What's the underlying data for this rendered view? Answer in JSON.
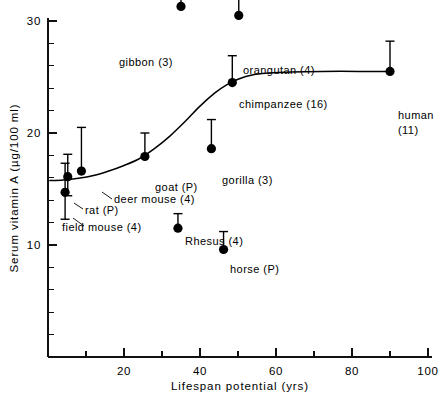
{
  "chart_data": {
    "type": "scatter",
    "title": "",
    "xlabel": "Lifespan potential (yrs)",
    "ylabel": "Serum vitamin A (µg/100 ml)",
    "xlim": [
      0,
      100
    ],
    "ylim": [
      0,
      34
    ],
    "grid": false,
    "legend": "none",
    "x_ticks_major": [
      20,
      40,
      60,
      80,
      100
    ],
    "x_tick_labels": [
      "20",
      "40",
      "60",
      "80",
      "100"
    ],
    "x_ticks_minor": [
      10,
      30,
      50,
      70,
      90
    ],
    "y_ticks_major": [
      10,
      20,
      30
    ],
    "y_tick_labels": [
      "10",
      "20",
      "30"
    ],
    "y_ticks_minor": [
      2,
      4,
      6,
      8,
      12,
      14,
      16,
      18,
      22,
      24,
      26,
      28,
      32,
      34
    ],
    "error_bar_style": "upper-only",
    "points": [
      {
        "name": "field mouse",
        "label": "field mouse (4)",
        "n": "4",
        "x": 4.5,
        "y": 14.7,
        "err_up": 2.6,
        "err_down": 2.4,
        "label_x": 62,
        "label_y": 231,
        "anchor": "start",
        "leader": true,
        "leader_path": "M 73 218 L 84 226"
      },
      {
        "name": "rat",
        "label": "rat (P)",
        "n": "P",
        "x": 5.2,
        "y": 16.1,
        "err_up": 2.0,
        "err_down": 1.7,
        "label_x": 85,
        "label_y": 214,
        "anchor": "start",
        "leader": true,
        "leader_path": "M 74 203 L 83 209"
      },
      {
        "name": "deer mouse",
        "label": "deer mouse (4)",
        "n": "4",
        "x": 8.8,
        "y": 16.6,
        "err_up": 3.9,
        "err_down": 0,
        "label_x": 114,
        "label_y": 203,
        "anchor": "start",
        "leader": true,
        "leader_path": "M 102 192 L 112 199"
      },
      {
        "name": "goat",
        "label": "goat (P)",
        "n": "P",
        "x": 25.5,
        "y": 17.9,
        "err_up": 2.1,
        "err_down": 0,
        "label_x": 155,
        "label_y": 191,
        "anchor": "start",
        "leader": false,
        "leader_path": ""
      },
      {
        "name": "Rhesus",
        "label": "Rhesus (4)",
        "n": "4",
        "x": 34.2,
        "y": 11.5,
        "err_up": 1.3,
        "err_down": 0,
        "label_x": 185,
        "label_y": 245,
        "anchor": "start",
        "leader": false,
        "leader_path": ""
      },
      {
        "name": "gibbon",
        "label": "gibbon (3)",
        "n": "3",
        "x": 35.0,
        "y": 31.3,
        "err_up": 2.3,
        "err_down": 0,
        "label_x": 173,
        "label_y": 66,
        "anchor": "end",
        "leader": false,
        "leader_path": ""
      },
      {
        "name": "gorilla",
        "label": "gorilla (3)",
        "n": "3",
        "x": 43.0,
        "y": 18.6,
        "err_up": 2.6,
        "err_down": 0,
        "label_x": 222,
        "label_y": 184,
        "anchor": "start",
        "leader": false,
        "leader_path": ""
      },
      {
        "name": "horse",
        "label": "horse (P)",
        "n": "P",
        "x": 46.2,
        "y": 9.6,
        "err_up": 1.6,
        "err_down": 0,
        "label_x": 230,
        "label_y": 273,
        "anchor": "start",
        "leader": false,
        "leader_path": ""
      },
      {
        "name": "chimpanzee",
        "label": "chimpanzee (16)",
        "n": "16",
        "x": 48.5,
        "y": 24.5,
        "err_up": 2.4,
        "err_down": 0,
        "label_x": 239,
        "label_y": 108,
        "anchor": "start",
        "leader": false,
        "leader_path": ""
      },
      {
        "name": "orangutan",
        "label": "orangutan (4)",
        "n": "4",
        "x": 50.2,
        "y": 30.5,
        "err_up": 2.5,
        "err_down": 0,
        "label_x": 243,
        "label_y": 74,
        "anchor": "start",
        "leader": false,
        "leader_path": ""
      },
      {
        "name": "human",
        "label": "human",
        "n": "11",
        "x": 90.0,
        "y": 25.5,
        "err_up": 2.7,
        "err_down": 0,
        "label_x": 398,
        "label_y": 119,
        "anchor": "start",
        "leader": false,
        "leader_path": ""
      }
    ],
    "human_second_line": "(11)",
    "fit_curve_description": "sigmoid trend rising from ~15.8 at low lifespan to plateau ~25.5 above 55 yrs",
    "fit_curve": [
      {
        "x": 0.5,
        "y": 15.75
      },
      {
        "x": 4.0,
        "y": 15.8
      },
      {
        "x": 8.0,
        "y": 15.95
      },
      {
        "x": 12.0,
        "y": 16.2
      },
      {
        "x": 16.0,
        "y": 16.6
      },
      {
        "x": 20.0,
        "y": 17.1
      },
      {
        "x": 24.0,
        "y": 17.7
      },
      {
        "x": 28.0,
        "y": 18.6
      },
      {
        "x": 32.0,
        "y": 19.7
      },
      {
        "x": 36.0,
        "y": 21.0
      },
      {
        "x": 40.0,
        "y": 22.4
      },
      {
        "x": 44.0,
        "y": 23.6
      },
      {
        "x": 47.0,
        "y": 24.3
      },
      {
        "x": 50.0,
        "y": 24.8
      },
      {
        "x": 54.0,
        "y": 25.2
      },
      {
        "x": 58.0,
        "y": 25.35
      },
      {
        "x": 64.0,
        "y": 25.45
      },
      {
        "x": 72.0,
        "y": 25.5
      },
      {
        "x": 82.0,
        "y": 25.5
      },
      {
        "x": 90.0,
        "y": 25.5
      }
    ]
  },
  "axes": {
    "x_title": "Lifespan potential (yrs)",
    "y_title": "Serum vitamin A (µg/100 ml)",
    "x_labels": [
      "20",
      "40",
      "60",
      "80",
      "100"
    ],
    "y_labels": [
      "30",
      "20",
      "10"
    ]
  }
}
